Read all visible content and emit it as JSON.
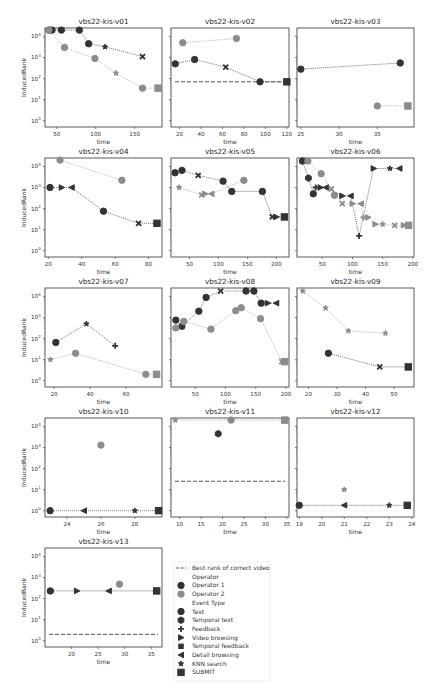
{
  "figure": {
    "caption": "",
    "ylabel": "InducedRank",
    "xlabel": "time"
  },
  "legend": {
    "items": [
      {
        "label": "Best rank of correct video",
        "kind": "dashed"
      },
      {
        "label": "Operator",
        "kind": "header"
      },
      {
        "label": "Operator 1",
        "kind": "op1"
      },
      {
        "label": "Operator 2",
        "kind": "op2"
      },
      {
        "label": "Event Type",
        "kind": "header"
      },
      {
        "label": "Text",
        "kind": "circle"
      },
      {
        "label": "Temporal text",
        "kind": "hexagon"
      },
      {
        "label": "Feedback",
        "kind": "plus"
      },
      {
        "label": "Video browsing",
        "kind": "tri-right"
      },
      {
        "label": "Temporal feedback",
        "kind": "square-small"
      },
      {
        "label": "Detail browsing",
        "kind": "tri-left"
      },
      {
        "label": "KNN search",
        "kind": "star"
      },
      {
        "label": "SUBMIT",
        "kind": "square"
      }
    ]
  },
  "colors": {
    "op1": "#333333",
    "op2": "#8c8c8c",
    "frame": "#333333",
    "best": "#444444"
  },
  "chart_data": [
    {
      "type": "line",
      "title": "vbs22-kis-v01",
      "xlim": [
        35,
        185
      ],
      "xticks": [
        50,
        100,
        150
      ],
      "ylog": true,
      "ylim_exp": [
        -0.3,
        4.4
      ],
      "best_rank": null,
      "series": [
        {
          "name": "Operator 1",
          "points": [
            [
              40,
              20000,
              "circle"
            ],
            [
              44,
              20000,
              "circle"
            ],
            [
              56,
              20000,
              "circle"
            ],
            [
              79,
              20000,
              "circle"
            ],
            [
              91,
              4500,
              "circle"
            ],
            [
              112,
              3200,
              "star"
            ],
            [
              160,
              1100,
              "x"
            ]
          ]
        },
        {
          "name": "Operator 2",
          "points": [
            [
              40,
              20000,
              "circle"
            ],
            [
              60,
              3000,
              "circle"
            ],
            [
              99,
              900,
              "circle"
            ],
            [
              126,
              180,
              "star"
            ],
            [
              160,
              35,
              "circle"
            ],
            [
              180,
              35,
              "square"
            ]
          ]
        }
      ]
    },
    {
      "type": "line",
      "title": "vbs22-kis-v02",
      "xlim": [
        12,
        122
      ],
      "xticks": [
        20,
        40,
        60,
        80,
        100,
        120
      ],
      "ylog": true,
      "ylim_exp": [
        -0.3,
        4.4
      ],
      "best_rank": 70,
      "series": [
        {
          "name": "Operator 1",
          "points": [
            [
              16,
              500,
              "circle"
            ],
            [
              34,
              800,
              "circle"
            ],
            [
              63,
              350,
              "x"
            ],
            [
              95,
              70,
              "circle"
            ],
            [
              120,
              70,
              "square"
            ]
          ]
        },
        {
          "name": "Operator 2",
          "points": [
            [
              23,
              5000,
              "circle"
            ],
            [
              73,
              8000,
              "circle"
            ]
          ]
        }
      ]
    },
    {
      "type": "line",
      "title": "vbs22-kis-v03",
      "xlim": [
        24.5,
        39.8
      ],
      "xticks": [
        25,
        30,
        35
      ],
      "ylog": true,
      "ylim_exp": [
        -0.3,
        4.4
      ],
      "best_rank": null,
      "series": [
        {
          "name": "Operator 1",
          "points": [
            [
              25,
              280,
              "circle"
            ],
            [
              38,
              550,
              "circle"
            ]
          ]
        },
        {
          "name": "Operator 2",
          "points": [
            [
              35,
              5,
              "circle"
            ],
            [
              39,
              5,
              "square"
            ]
          ]
        }
      ]
    },
    {
      "type": "line",
      "title": "vbs22-kis-v04",
      "xlim": [
        18,
        88
      ],
      "xticks": [
        20,
        40,
        60,
        80
      ],
      "ylog": true,
      "ylim_exp": [
        -0.3,
        4.4
      ],
      "best_rank": null,
      "series": [
        {
          "name": "Operator 1",
          "points": [
            [
              21,
              1000,
              "circle"
            ],
            [
              28,
              1000,
              "tri-right"
            ],
            [
              34,
              1000,
              "tri-left"
            ],
            [
              53,
              75,
              "circle"
            ],
            [
              74,
              20,
              "x"
            ],
            [
              85,
              20,
              "square"
            ]
          ]
        },
        {
          "name": "Operator 2",
          "points": [
            [
              27,
              20000,
              "circle"
            ],
            [
              64,
              2200,
              "circle"
            ]
          ]
        }
      ]
    },
    {
      "type": "line",
      "title": "vbs22-kis-v05",
      "xlim": [
        18,
        222
      ],
      "xticks": [
        50,
        100,
        150,
        200
      ],
      "ylog": true,
      "ylim_exp": [
        -0.3,
        4.4
      ],
      "best_rank": null,
      "series": [
        {
          "name": "Operator 1",
          "points": [
            [
              25,
              5000,
              "circle"
            ],
            [
              37,
              6500,
              "circle"
            ],
            [
              65,
              3800,
              "x"
            ],
            [
              108,
              2000,
              "circle"
            ],
            [
              123,
              650,
              "circle"
            ],
            [
              176,
              650,
              "circle"
            ],
            [
              193,
              40,
              "x"
            ],
            [
              200,
              40,
              "tri-right"
            ],
            [
              214,
              40,
              "square"
            ]
          ]
        },
        {
          "name": "Operator 2",
          "points": [
            [
              32,
              1000,
              "star"
            ],
            [
              71,
              450,
              "x"
            ],
            [
              77,
              500,
              "tri-right"
            ],
            [
              88,
              500,
              "tri-left"
            ],
            [
              144,
              2200,
              "circle"
            ]
          ]
        }
      ]
    },
    {
      "type": "line",
      "title": "vbs22-kis-v06",
      "xlim": [
        8,
        202
      ],
      "xticks": [
        50,
        100,
        150,
        200
      ],
      "ylog": true,
      "ylim_exp": [
        -0.3,
        4.4
      ],
      "best_rank": null,
      "series": [
        {
          "name": "Operator 1",
          "points": [
            [
              17,
              18000,
              "circle"
            ],
            [
              27,
              2800,
              "hexagon"
            ],
            [
              35,
              500,
              "circle"
            ],
            [
              39,
              1000,
              "plus"
            ],
            [
              47,
              1000,
              "tri-right"
            ],
            [
              56,
              1000,
              "tri-left"
            ],
            [
              83,
              400,
              "tri-right"
            ],
            [
              97,
              400,
              "tri-left"
            ],
            [
              111,
              5,
              "plus"
            ],
            [
              135,
              8000,
              "tri-right"
            ],
            [
              162,
              8000,
              "star"
            ],
            [
              178,
              8000,
              "tri-left"
            ]
          ]
        },
        {
          "name": "Operator 2",
          "points": [
            [
              26,
              18000,
              "circle"
            ],
            [
              48,
              4500,
              "circle"
            ],
            [
              65,
              850,
              "x"
            ],
            [
              70,
              430,
              "circle"
            ],
            [
              83,
              170,
              "x"
            ],
            [
              100,
              170,
              "tri-right"
            ],
            [
              114,
              170,
              "tri-left"
            ],
            [
              118,
              38,
              "plus"
            ],
            [
              126,
              38,
              "tri-right"
            ],
            [
              138,
              18,
              "tri-right"
            ],
            [
              150,
              18,
              "star"
            ],
            [
              170,
              16,
              "x"
            ],
            [
              185,
              16,
              "tri-right"
            ],
            [
              193,
              16,
              "square"
            ]
          ]
        }
      ]
    },
    {
      "type": "line",
      "title": "vbs22-kis-v07",
      "xlim": [
        15,
        80
      ],
      "xticks": [
        20,
        40,
        60
      ],
      "ylog": true,
      "ylim_exp": [
        -0.3,
        4.4
      ],
      "best_rank": null,
      "series": [
        {
          "name": "Operator 1",
          "points": [
            [
              21,
              65,
              "circle"
            ],
            [
              38,
              500,
              "star"
            ],
            [
              54,
              45,
              "plus"
            ]
          ]
        },
        {
          "name": "Operator 2",
          "points": [
            [
              18,
              10,
              "star"
            ],
            [
              32,
              20,
              "circle"
            ],
            [
              71,
              2,
              "circle"
            ],
            [
              77,
              2,
              "square"
            ]
          ]
        }
      ]
    },
    {
      "type": "line",
      "title": "vbs22-kis-v08",
      "xlim": [
        10,
        205
      ],
      "xticks": [
        50,
        100,
        150,
        200
      ],
      "ylog": true,
      "ylim_exp": [
        -0.3,
        4.4
      ],
      "best_rank": null,
      "series": [
        {
          "name": "Operator 1",
          "points": [
            [
              18,
              750,
              "circle"
            ],
            [
              28,
              380,
              "circle"
            ],
            [
              56,
              2000,
              "circle"
            ],
            [
              68,
              9000,
              "circle"
            ],
            [
              92,
              18000,
              "x"
            ],
            [
              134,
              18000,
              "circle"
            ],
            [
              147,
              18000,
              "circle"
            ],
            [
              159,
              4800,
              "circle"
            ],
            [
              170,
              4800,
              "tri-right"
            ],
            [
              184,
              4800,
              "tri-left"
            ]
          ]
        },
        {
          "name": "Operator 2",
          "points": [
            [
              18,
              320,
              "circle"
            ],
            [
              31,
              650,
              "circle"
            ],
            [
              76,
              280,
              "circle"
            ],
            [
              117,
              2100,
              "circle"
            ],
            [
              126,
              2900,
              "circle"
            ],
            [
              158,
              880,
              "circle"
            ],
            [
              193,
              8,
              "x"
            ],
            [
              198,
              8,
              "square"
            ]
          ]
        }
      ]
    },
    {
      "type": "line",
      "title": "vbs22-kis-v09",
      "xlim": [
        16,
        57
      ],
      "xticks": [
        20,
        30,
        40,
        50
      ],
      "ylog": true,
      "ylim_exp": [
        -0.3,
        4.4
      ],
      "best_rank": null,
      "series": [
        {
          "name": "Operator 1",
          "points": [
            [
              27,
              20,
              "circle"
            ],
            [
              45,
              4.5,
              "x"
            ],
            [
              55,
              4.5,
              "square"
            ]
          ]
        },
        {
          "name": "Operator 2",
          "points": [
            [
              18,
              18000,
              "star"
            ],
            [
              26,
              2800,
              "star"
            ],
            [
              34,
              230,
              "star"
            ],
            [
              47,
              180,
              "star"
            ]
          ]
        }
      ]
    },
    {
      "type": "line",
      "title": "vbs22-kis-v10",
      "xlim": [
        22.7,
        29.6
      ],
      "xticks": [
        24,
        26,
        28
      ],
      "ylog": true,
      "ylim_exp": [
        -0.3,
        4.4
      ],
      "best_rank": null,
      "series": [
        {
          "name": "Operator 1",
          "points": [
            [
              23,
              1,
              "circle"
            ],
            [
              25,
              1,
              "tri-left"
            ],
            [
              28,
              1,
              "star"
            ],
            [
              29.4,
              1,
              "square"
            ]
          ]
        },
        {
          "name": "Operator 2",
          "points": [
            [
              26,
              1300,
              "circle"
            ]
          ]
        }
      ]
    },
    {
      "type": "line",
      "title": "vbs22-kis-v11",
      "xlim": [
        8,
        35.5
      ],
      "xticks": [
        10,
        15,
        20,
        25,
        30,
        35
      ],
      "ylog": true,
      "ylim_exp": [
        -0.3,
        4.4
      ],
      "best_rank": 25,
      "series": [
        {
          "name": "Operator 1",
          "points": [
            [
              19,
              4500,
              "hexagon"
            ]
          ]
        },
        {
          "name": "Operator 2",
          "points": [
            [
              9,
              20000,
              "star"
            ],
            [
              22,
              20000,
              "circle"
            ],
            [
              34.5,
              20000,
              "square"
            ]
          ]
        }
      ]
    },
    {
      "type": "line",
      "title": "vbs22-kis-v12",
      "xlim": [
        18.9,
        24.1
      ],
      "xticks": [
        19,
        20,
        21,
        22,
        23,
        24
      ],
      "ylog": true,
      "ylim_exp": [
        -0.3,
        4.4
      ],
      "best_rank": null,
      "series": [
        {
          "name": "Operator 1",
          "points": [
            [
              19,
              1.8,
              "circle"
            ],
            [
              21,
              1.8,
              "tri-left"
            ],
            [
              23,
              1.8,
              "star"
            ],
            [
              23.8,
              1.8,
              "square"
            ]
          ]
        },
        {
          "name": "Operator 2",
          "points": [
            [
              21,
              10,
              "star"
            ]
          ]
        }
      ]
    },
    {
      "type": "line",
      "title": "vbs22-kis-v13",
      "xlim": [
        15,
        37
      ],
      "xticks": [
        20,
        25,
        30,
        35
      ],
      "ylog": true,
      "ylim_exp": [
        -0.3,
        4.4
      ],
      "best_rank": 2,
      "series": [
        {
          "name": "Operator 1",
          "points": [
            [
              16,
              230,
              "circle"
            ],
            [
              21,
              230,
              "tri-right"
            ],
            [
              27,
              230,
              "tri-left"
            ],
            [
              36,
              230,
              "square"
            ]
          ]
        },
        {
          "name": "Operator 2",
          "points": [
            [
              29,
              480,
              "circle"
            ]
          ]
        }
      ]
    }
  ]
}
